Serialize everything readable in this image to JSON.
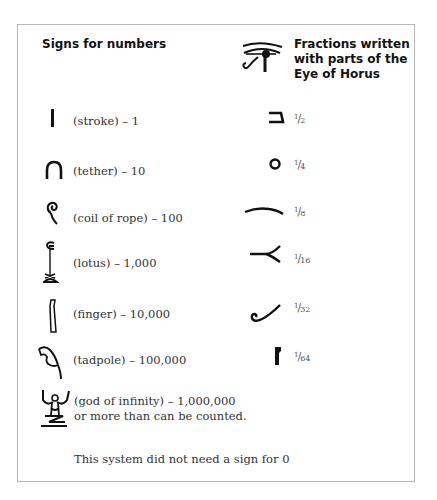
{
  "headings": {
    "numbers": "Signs for numbers",
    "fractions": "Fractions written with parts of the Eye of Horus"
  },
  "numbers": [
    {
      "icon": "stroke-icon",
      "label": "(stroke) – 1"
    },
    {
      "icon": "tether-icon",
      "label": "(tether) – 10"
    },
    {
      "icon": "coil-of-rope-icon",
      "label": "(coil of rope) – 100"
    },
    {
      "icon": "lotus-icon",
      "label": "(lotus) – 1,000"
    },
    {
      "icon": "finger-icon",
      "label": "(finger) – 10,000"
    },
    {
      "icon": "tadpole-icon",
      "label": "(tadpole) – 100,000"
    },
    {
      "icon": "god-of-infinity-icon",
      "label": "(god of infinity) – 1,000,000",
      "label2": "or more than can be counted."
    }
  ],
  "fractions": [
    {
      "icon": "eye-part-half-icon",
      "num": "1",
      "den": "2"
    },
    {
      "icon": "eye-part-quarter-icon",
      "num": "1",
      "den": "4"
    },
    {
      "icon": "eye-part-eighth-icon",
      "num": "1",
      "den": "8"
    },
    {
      "icon": "eye-part-sixteenth-icon",
      "num": "1",
      "den": "16"
    },
    {
      "icon": "eye-part-thirtysecond-icon",
      "num": "1",
      "den": "32"
    },
    {
      "icon": "eye-part-sixtyfourth-icon",
      "num": "1",
      "den": "64"
    }
  ],
  "footnote": "This system did not need a sign for 0"
}
